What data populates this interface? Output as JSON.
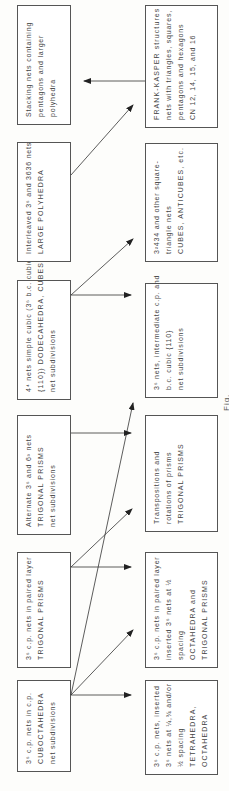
{
  "figure": {
    "caption": "Fig."
  },
  "top_row": [
    {
      "id": "cuboct",
      "lines": [
        "3⁶ c.p. nets in c.p.",
        "CUBOCTAHEDRA",
        "net subdivisions"
      ]
    },
    {
      "id": "paired",
      "lines": [
        "3⁶ c.p. nets in paired layer",
        "TRIGONAL PRISMS"
      ]
    },
    {
      "id": "alternate",
      "lines": [
        "Alternate 3⁶ and 6³ nets",
        "TRIGONAL PRISMS",
        "net subdivisions"
      ]
    },
    {
      "id": "simplecubic",
      "lines": [
        "4⁴ nets simple cubic (3⁶ b.c. cubic",
        "{110}) DODECAHEDRA, CUBES",
        "net subdivisions"
      ]
    },
    {
      "id": "interleaved",
      "lines": [
        "Interleaved 3⁶ and 3636 nets",
        "LARGE POLYHEDRA"
      ]
    },
    {
      "id": "stacking",
      "lines": [
        "Stacking nets containing",
        "pentagons and larger",
        "polyhedra"
      ]
    }
  ],
  "bottom_row": [
    {
      "id": "inserted",
      "lines": [
        "3⁶ c.p. nets, inserted",
        "3⁶ nets at ¼,¾ and/or",
        "½ spacing",
        "TETRAHEDRA,",
        "OCTAHEDRA"
      ]
    },
    {
      "id": "paired_inserted",
      "lines": [
        "3⁶ c.p. nets in paired layer",
        "inserted 3⁶ nets at ½",
        "spacing",
        "OCTAHEDRA and",
        "TRIGONAL PRISMS"
      ]
    },
    {
      "id": "transpositions",
      "lines": [
        "Transpositions and",
        "rotations of prisms",
        "TRIGONAL PRISMS"
      ]
    },
    {
      "id": "intermediate",
      "lines": [
        "3⁶ nets, intermediate c.p. and",
        "b.c. cubic   {110}",
        "net subdivisions"
      ]
    },
    {
      "id": "squaretriangle",
      "lines": [
        "3²434 and other square-",
        "triangle nets",
        "CUBES, ANTICUBES, etc."
      ]
    },
    {
      "id": "frankkasper",
      "lines": [
        "FRANK-KASPER structures",
        "nets with triangles, squares,",
        "pentagons and hexagons",
        "CN 12, 14, 15, and 16"
      ]
    }
  ],
  "colors": {
    "line": "#333333",
    "border": "#555555",
    "text": "#444444"
  }
}
